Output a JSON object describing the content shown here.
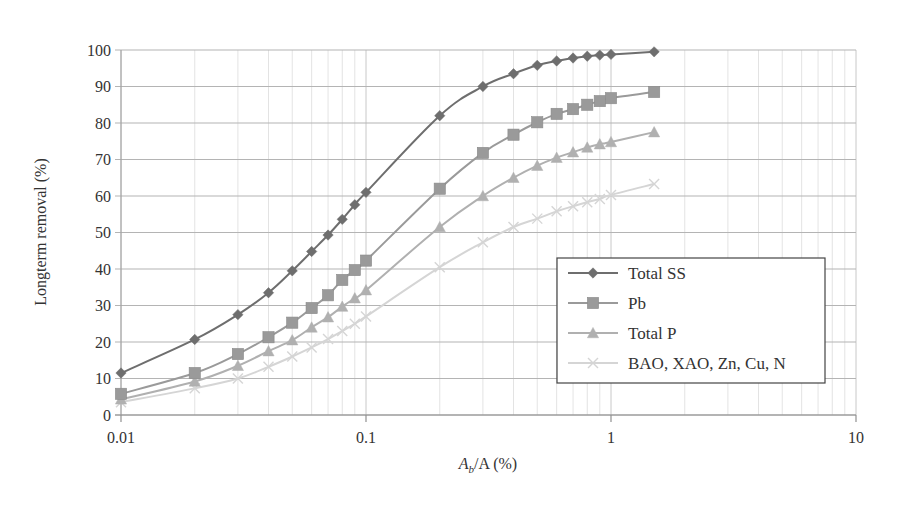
{
  "chart_data": {
    "type": "line",
    "title": "",
    "xlabel": "A_b/A (%)",
    "xlabel_parts": {
      "main": "A",
      "sub": "b",
      "rest": "/A (%)"
    },
    "ylabel": "Longterm removal (%)",
    "xscale": "log",
    "xlim": [
      0.01,
      10
    ],
    "ylim": [
      0,
      100
    ],
    "x_ticks": [
      0.01,
      0.1,
      1,
      10
    ],
    "x_tick_labels": [
      "0.01",
      "0.1",
      "1",
      "10"
    ],
    "y_ticks": [
      0,
      10,
      20,
      30,
      40,
      50,
      60,
      70,
      80,
      90,
      100
    ],
    "y_tick_labels": [
      "0",
      "10",
      "20",
      "30",
      "40",
      "50",
      "60",
      "70",
      "80",
      "90",
      "100"
    ],
    "grid": {
      "major_y": true,
      "major_x": true,
      "minor_x": true
    },
    "legend_position": "lower right (inside)",
    "x": [
      0.01,
      0.02,
      0.03,
      0.04,
      0.05,
      0.06,
      0.07,
      0.08,
      0.09,
      0.1,
      0.2,
      0.3,
      0.4,
      0.5,
      0.6,
      0.7,
      0.8,
      0.9,
      1.0,
      1.5
    ],
    "series": [
      {
        "name": "Total SS",
        "marker": "diamond",
        "color": "#6e6e6e",
        "values": [
          11.5,
          20.7,
          27.5,
          33.5,
          39.5,
          44.8,
          49.3,
          53.6,
          57.6,
          61.0,
          82.0,
          90.0,
          93.5,
          95.8,
          97.0,
          97.8,
          98.3,
          98.6,
          98.8,
          99.5
        ]
      },
      {
        "name": "Pb",
        "marker": "square",
        "color": "#9a9a9a",
        "values": [
          5.8,
          11.5,
          16.7,
          21.3,
          25.3,
          29.3,
          32.8,
          37.0,
          39.7,
          42.3,
          62.0,
          71.8,
          76.8,
          80.2,
          82.5,
          83.8,
          85.0,
          86.0,
          86.8,
          88.5
        ]
      },
      {
        "name": "Total P",
        "marker": "triangle",
        "color": "#b0b0b0",
        "values": [
          4.3,
          9.2,
          13.5,
          17.5,
          20.5,
          24.0,
          26.8,
          29.7,
          32.0,
          34.2,
          51.5,
          60.0,
          65.0,
          68.3,
          70.5,
          72.0,
          73.3,
          74.2,
          74.8,
          77.5
        ]
      },
      {
        "name": "BAO, XAO, Zn, Cu, N",
        "marker": "x",
        "color": "#d5d5d5",
        "values": [
          3.5,
          7.3,
          10.0,
          13.2,
          16.0,
          18.5,
          20.8,
          23.0,
          25.0,
          27.0,
          40.5,
          47.3,
          51.5,
          53.8,
          55.8,
          57.2,
          58.3,
          59.2,
          60.3,
          63.3
        ]
      }
    ]
  },
  "legend": {
    "items": [
      {
        "label": "Total SS"
      },
      {
        "label": "Pb"
      },
      {
        "label": "Total P"
      },
      {
        "label": "BAO, XAO, Zn, Cu, N"
      }
    ]
  }
}
